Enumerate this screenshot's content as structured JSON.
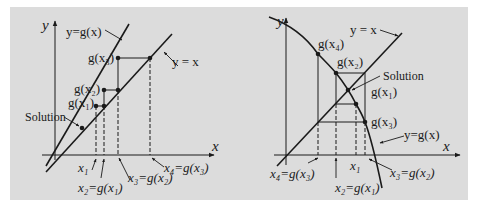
{
  "figure": {
    "background": "#dcdcdc",
    "line_color": "#1a1a1a",
    "left": {
      "axis_x": "x",
      "axis_y": "y",
      "curve_label": "y=g(x)",
      "identity_label": "y = x",
      "solution_label": "Solution",
      "gx1": "g(x₁)",
      "gx2": "g(x₂)",
      "gx3": "g(x₃)",
      "x1": "x₁",
      "x2": "x₂=g(x₁)",
      "x3": "x₃=g(x₂)",
      "x4": "x₄=g(x₃)"
    },
    "right": {
      "axis_x": "x",
      "axis_y": "y",
      "curve_label": "y=g(x)",
      "identity_label": "y = x",
      "solution_label": "Solution",
      "gx1": "g(x₁)",
      "gx2": "g(x₂)",
      "gx3": "g(x₃)",
      "gx4": "g(x₄)",
      "x1": "x₁",
      "x2": "x₂=g(x₁)",
      "x3": "x₃=g(x₂)",
      "x4": "x₄=g(x₃)"
    }
  }
}
